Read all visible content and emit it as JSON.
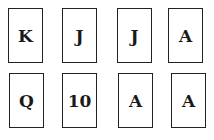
{
  "cards": [
    {
      "rank": "K"
    },
    {
      "rank": "J"
    },
    {
      "rank": "J"
    },
    {
      "rank": "A"
    },
    {
      "rank": "Q"
    },
    {
      "rank": "10"
    },
    {
      "rank": "A"
    },
    {
      "rank": "A"
    }
  ]
}
